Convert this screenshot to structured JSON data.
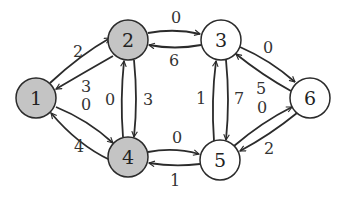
{
  "graph": {
    "colors": {
      "shaded_fill": "#c4c4c4",
      "plain_fill": "#ffffff",
      "stroke": "#2b2b2b"
    },
    "nodes": [
      {
        "id": "1",
        "label": "1",
        "x": 36,
        "y": 98,
        "shaded": true
      },
      {
        "id": "2",
        "label": "2",
        "x": 128,
        "y": 40,
        "shaded": true
      },
      {
        "id": "3",
        "label": "3",
        "x": 221,
        "y": 40,
        "shaded": false
      },
      {
        "id": "4",
        "label": "4",
        "x": 128,
        "y": 157,
        "shaded": true
      },
      {
        "id": "5",
        "label": "5",
        "x": 220,
        "y": 160,
        "shaded": false
      },
      {
        "id": "6",
        "label": "6",
        "x": 310,
        "y": 98,
        "shaded": false
      }
    ],
    "edges": [
      {
        "from": "1",
        "to": "2",
        "weight": "2"
      },
      {
        "from": "2",
        "to": "1",
        "weight": "3"
      },
      {
        "from": "1",
        "to": "4",
        "weight": "0"
      },
      {
        "from": "4",
        "to": "1",
        "weight": "4"
      },
      {
        "from": "2",
        "to": "3",
        "weight": "0"
      },
      {
        "from": "3",
        "to": "2",
        "weight": "6"
      },
      {
        "from": "4",
        "to": "2",
        "weight": "0"
      },
      {
        "from": "2",
        "to": "4",
        "weight": "3"
      },
      {
        "from": "5",
        "to": "3",
        "weight": "1"
      },
      {
        "from": "3",
        "to": "5",
        "weight": "7"
      },
      {
        "from": "3",
        "to": "6",
        "weight": "0"
      },
      {
        "from": "6",
        "to": "3",
        "weight": "5"
      },
      {
        "from": "4",
        "to": "5",
        "weight": "0"
      },
      {
        "from": "5",
        "to": "4",
        "weight": "1"
      },
      {
        "from": "5",
        "to": "6",
        "weight": "0"
      },
      {
        "from": "6",
        "to": "5",
        "weight": "2"
      }
    ]
  }
}
